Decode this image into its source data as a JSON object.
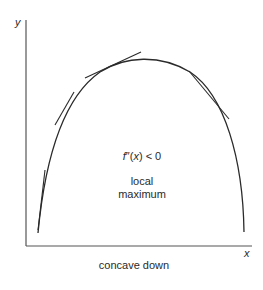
{
  "diagram": {
    "axes": {
      "y_label": "y",
      "x_label": "x"
    },
    "condition": {
      "function": "f",
      "primes": "″",
      "arg_open": "(",
      "variable": "x",
      "arg_close": ")",
      "relation": " < 0"
    },
    "annotation": {
      "line1": "local",
      "line2": "maximum"
    },
    "caption": "concave down",
    "colors": {
      "stroke": "#2a2a2a",
      "background": "#ffffff"
    }
  }
}
